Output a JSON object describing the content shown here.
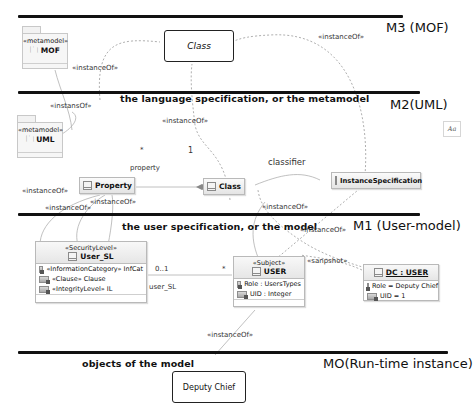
{
  "levels": {
    "m3": {
      "label": "M3 (MOF)"
    },
    "m2": {
      "label": "M2(UML)",
      "caption": "the language specification, or the metamodel"
    },
    "m1": {
      "label": "M1 (User-model)",
      "caption": "the user specification, or the model"
    },
    "m0": {
      "label": "MO(Run-time instance)",
      "caption": "objects of the model"
    }
  },
  "packages": {
    "mof": {
      "stereotype": "«metamodel»",
      "name": "MOF"
    },
    "uml": {
      "stereotype": "«metamodel»",
      "name": "UML"
    }
  },
  "m3_class": {
    "name": "Class"
  },
  "m2_classes": {
    "property": {
      "name": "Property"
    },
    "class": {
      "name": "Class"
    },
    "instance_spec": {
      "name": "InstanceSpecification"
    }
  },
  "m1_classes": {
    "user_sl": {
      "stereotype": "«SecurityLevel»",
      "name": "User_SL",
      "attributes": [
        "«InformationCategory» InfCat",
        "«Clause» Clause",
        "«IntegrityLevel» IL"
      ]
    },
    "user": {
      "stereotype": "«Subject»",
      "name": "USER",
      "attributes": [
        "Role : UsersTypes",
        "UID : Integer"
      ]
    },
    "dc_user": {
      "name": "DC : USER",
      "attributes": [
        "Role = Deputy Chief",
        "UID = 1"
      ]
    }
  },
  "m0_object": {
    "name": "Deputy Chief"
  },
  "relations": {
    "instance_of": "«instanceOf»",
    "instans_of": "«instansOf»",
    "snapshot": "«sanpshot»",
    "property_role": "property",
    "multiplicity_many": "*",
    "multiplicity_one": "1",
    "classifier": "classifier",
    "user_sl_role": "user_SL",
    "multiplicity_0_1": "0..1",
    "multiplicity_star2": "*"
  },
  "side_widget": {
    "label": "Aa"
  }
}
